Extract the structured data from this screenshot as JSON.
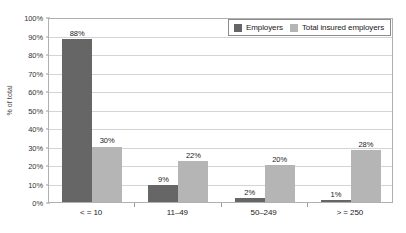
{
  "chart_data": {
    "type": "bar",
    "title": "",
    "subtitle": "",
    "xlabel": "",
    "ylabel": "% of total",
    "ylim": [
      0,
      100
    ],
    "ytick_labels": [
      "0%",
      "10%",
      "20%",
      "30%",
      "40%",
      "50%",
      "60%",
      "70%",
      "80%",
      "90%",
      "100%"
    ],
    "ytick_values": [
      0,
      10,
      20,
      30,
      40,
      50,
      60,
      70,
      80,
      90,
      100
    ],
    "grid": true,
    "legend_position": "top-right",
    "categories": [
      "< = 10",
      "11–49",
      "50–249",
      "> = 250"
    ],
    "series": [
      {
        "name": "Employers",
        "color": "#666666",
        "values": [
          88,
          9,
          2,
          1
        ],
        "labels": [
          "88%",
          "9%",
          "2%",
          "1%"
        ]
      },
      {
        "name": "Total insured employers",
        "color": "#b5b5b5",
        "values": [
          30,
          22,
          20,
          28
        ],
        "labels": [
          "30%",
          "22%",
          "20%",
          "28%"
        ]
      }
    ]
  },
  "legend": {
    "entries": [
      {
        "label": "Employers",
        "color": "#666666"
      },
      {
        "label": "Total insured employers",
        "color": "#b5b5b5"
      }
    ]
  },
  "colors": {
    "series_dark": "#666666",
    "series_light": "#b5b5b5",
    "gridline": "#d4d4d4",
    "axis": "#b0b0b0",
    "text": "#1a1a1a",
    "background": "#ffffff"
  }
}
